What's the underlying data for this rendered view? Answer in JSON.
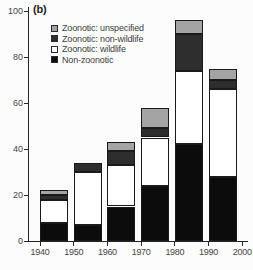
{
  "panel": {
    "label": "(b)"
  },
  "chart_data": {
    "type": "bar",
    "stacked": true,
    "title": "",
    "categories": [
      "1940s",
      "1950s",
      "1960s",
      "1970s",
      "1980s",
      "1990s"
    ],
    "x_tick_labels": [
      "1940",
      "1950",
      "1960",
      "1970",
      "1980",
      "1990",
      "2000"
    ],
    "series": [
      {
        "name": "Non-zoonotic",
        "color": "#0c0c0c",
        "values": [
          8,
          7,
          15,
          24,
          42,
          28
        ]
      },
      {
        "name": "Zoonotic: wildlife",
        "color": "#ffffff",
        "values": [
          10,
          23,
          18,
          21,
          32,
          38
        ]
      },
      {
        "name": "Zoonotic: non-wildlife",
        "color": "#2e2e2e",
        "values": [
          2,
          4,
          6,
          4,
          16,
          4
        ]
      },
      {
        "name": "Zoonotic: unspecified",
        "color": "#a4a4a4",
        "values": [
          2,
          0,
          4,
          9,
          6,
          5
        ]
      }
    ],
    "totals": [
      22,
      34,
      43,
      58,
      96,
      75
    ],
    "legend": {
      "position": "top-left",
      "entries": [
        "Zoonotic: unspecified",
        "Zoonotic: non-wildlife",
        "Zoonotic: wildlife",
        "Non-zoonotic"
      ]
    },
    "ylim": [
      0,
      100
    ],
    "yticks": [
      0,
      20,
      40,
      60,
      80,
      100
    ],
    "grid": false,
    "xlabel": "",
    "ylabel": ""
  },
  "colors": {
    "background": "#fcfcfc",
    "axis": "#262626",
    "tick_label": "#454545",
    "legend_text": "#3d3d3d",
    "segment_border": "#1a1a1a"
  }
}
